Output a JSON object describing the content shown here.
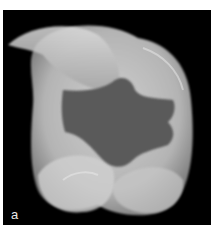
{
  "figure": {
    "panel_label": "a",
    "colors": {
      "background": "#000000",
      "tooth_light": "#d8d8d8",
      "tooth_mid": "#a8a8a8",
      "cavity": "#5a5a5a"
    }
  }
}
